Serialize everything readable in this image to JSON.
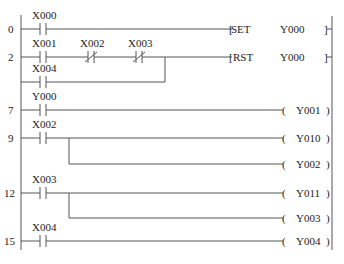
{
  "diagram": {
    "type": "ladder-logic",
    "rungs": [
      {
        "step": "0",
        "contacts": [
          {
            "name": "X000",
            "type": "NO"
          }
        ],
        "output": {
          "kind": "SET",
          "operand": "Y000"
        }
      },
      {
        "step": "2",
        "contacts": [
          {
            "name": "X001",
            "type": "NO"
          },
          {
            "name": "X002",
            "type": "NC"
          },
          {
            "name": "X003",
            "type": "NC"
          }
        ],
        "parallel": [
          {
            "name": "X004",
            "type": "NO"
          }
        ],
        "output": {
          "kind": "RST",
          "operand": "Y000"
        }
      },
      {
        "step": "7",
        "contacts": [
          {
            "name": "Y000",
            "type": "NO"
          }
        ],
        "output": {
          "kind": "coil",
          "operand": "Y001"
        }
      },
      {
        "step": "9",
        "contacts": [
          {
            "name": "X002",
            "type": "NO"
          }
        ],
        "outputs": [
          {
            "kind": "coil",
            "operand": "Y010"
          },
          {
            "kind": "coil",
            "operand": "Y002"
          }
        ]
      },
      {
        "step": "12",
        "contacts": [
          {
            "name": "X003",
            "type": "NO"
          }
        ],
        "outputs": [
          {
            "kind": "coil",
            "operand": "Y011"
          },
          {
            "kind": "coil",
            "operand": "Y003"
          }
        ]
      },
      {
        "step": "15",
        "contacts": [
          {
            "name": "X004",
            "type": "NO"
          }
        ],
        "output": {
          "kind": "coil",
          "operand": "Y004"
        }
      }
    ]
  },
  "labels": {
    "r0_step": "0",
    "r0_c1": "X000",
    "r0_instr": "SET",
    "r0_op": "Y000",
    "r1_step": "2",
    "r1_c1": "X001",
    "r1_c2": "X002",
    "r1_c3": "X003",
    "r1_p1": "X004",
    "r1_instr": "RST",
    "r1_op": "Y000",
    "r2_step": "7",
    "r2_c1": "Y000",
    "r2_coil": "Y001",
    "r3_step": "9",
    "r3_c1": "X002",
    "r3_coil1": "Y010",
    "r3_coil2": "Y002",
    "r4_step": "12",
    "r4_c1": "X003",
    "r4_coil1": "Y011",
    "r4_coil2": "Y003",
    "r5_step": "15",
    "r5_c1": "X004",
    "r5_coil": "Y004"
  }
}
